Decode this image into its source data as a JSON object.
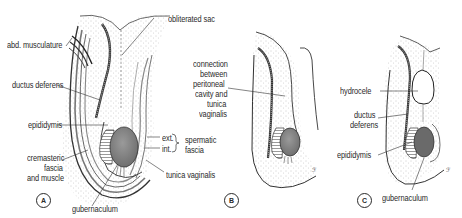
{
  "figure": {
    "panels": [
      {
        "id": "A",
        "labels": {
          "abd_musculature": "abd. musculature",
          "obliterated_sac": "obliterated sac",
          "ductus_deferens": "ductus deferens",
          "epididymis": "epididymis",
          "cremasteric": [
            "cremasteric",
            "fascia",
            "and muscle"
          ],
          "ext": "ext.",
          "int": "int.",
          "spermatic_fascia": [
            "spermatic",
            "fascia"
          ],
          "tunica_vaginalis": "tunica vaginalis",
          "gubernaculum": "gubernaculum"
        }
      },
      {
        "id": "B",
        "labels": {
          "connection": [
            "connection",
            "between",
            "peritoneal",
            "cavity and",
            "tunica",
            "vaginalis"
          ]
        }
      },
      {
        "id": "C",
        "labels": {
          "hydrocele": "hydrocele",
          "ductus_deferens": [
            "ductus",
            "deferens"
          ],
          "epididymis": "epididymis",
          "gubernaculum": "gubernaculum"
        }
      }
    ],
    "colors": {
      "ink": "#2a2a2a",
      "testis": "#8a8a8a",
      "stipple": "#b8b8b8",
      "background": "#ffffff"
    }
  }
}
